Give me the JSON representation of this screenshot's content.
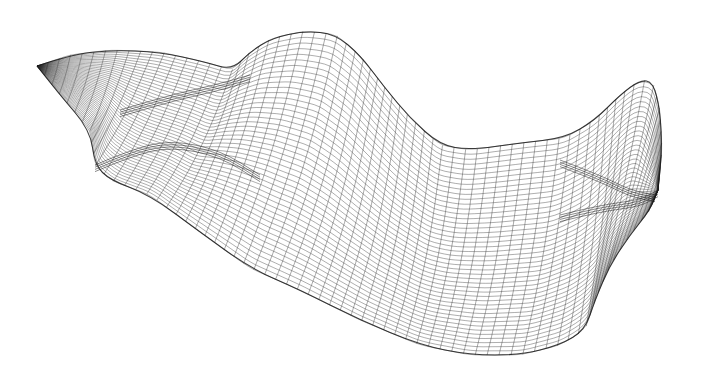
{
  "image": {
    "subject": "3D wireframe mesh surface",
    "width": 703,
    "height": 374,
    "background": "#ffffff",
    "line_color": "#2a2a2a"
  },
  "mesh": {
    "u_lines": 70,
    "v_lines": 46,
    "top_edge": [
      [
        37,
        66
      ],
      [
        70,
        55
      ],
      [
        110,
        50
      ],
      [
        160,
        52
      ],
      [
        205,
        62
      ],
      [
        232,
        70
      ],
      [
        250,
        52
      ],
      [
        272,
        38
      ],
      [
        305,
        31
      ],
      [
        335,
        34
      ],
      [
        360,
        55
      ],
      [
        385,
        88
      ],
      [
        410,
        118
      ],
      [
        440,
        145
      ],
      [
        470,
        150
      ],
      [
        520,
        143
      ],
      [
        565,
        138
      ],
      [
        595,
        120
      ],
      [
        620,
        95
      ],
      [
        640,
        80
      ],
      [
        653,
        82
      ],
      [
        660,
        110
      ],
      [
        662,
        150
      ],
      [
        658,
        190
      ]
    ],
    "bottom_edge": [
      [
        37,
        66
      ],
      [
        60,
        95
      ],
      [
        90,
        130
      ],
      [
        95,
        165
      ],
      [
        110,
        180
      ],
      [
        150,
        195
      ],
      [
        200,
        232
      ],
      [
        250,
        268
      ],
      [
        300,
        290
      ],
      [
        360,
        320
      ],
      [
        420,
        345
      ],
      [
        470,
        355
      ],
      [
        520,
        355
      ],
      [
        560,
        345
      ],
      [
        585,
        330
      ],
      [
        595,
        300
      ],
      [
        610,
        265
      ],
      [
        630,
        235
      ],
      [
        650,
        210
      ],
      [
        658,
        190
      ]
    ],
    "folds": [
      [
        [
          95,
          165
        ],
        [
          130,
          150
        ],
        [
          170,
          140
        ],
        [
          220,
          150
        ],
        [
          260,
          175
        ]
      ],
      [
        [
          120,
          110
        ],
        [
          170,
          95
        ],
        [
          215,
          85
        ],
        [
          250,
          75
        ]
      ],
      [
        [
          560,
          160
        ],
        [
          600,
          175
        ],
        [
          630,
          190
        ],
        [
          655,
          195
        ]
      ],
      [
        [
          560,
          215
        ],
        [
          600,
          205
        ],
        [
          640,
          200
        ],
        [
          658,
          190
        ]
      ]
    ]
  }
}
